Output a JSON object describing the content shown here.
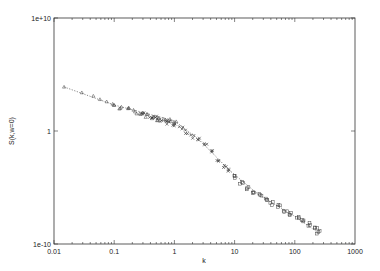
{
  "chart_data": {
    "type": "scatter",
    "title": "",
    "xlabel": "k",
    "ylabel": "S(k,w=0)",
    "xscale": "log",
    "yscale": "log",
    "xlim": [
      0.01,
      1000
    ],
    "ylim": [
      1e-10,
      10000000000.0
    ],
    "x_ticks": [
      "0.01",
      "0.1",
      "1",
      "10",
      "100",
      "1000"
    ],
    "y_ticks": [
      "1e-10",
      "1",
      "1e+10"
    ],
    "grid": false,
    "legend": null,
    "series": [
      {
        "name": "triangles",
        "marker": "triangle",
        "x": [
          0.0147,
          0.029,
          0.045,
          0.058,
          0.075,
          0.1,
          0.13,
          0.17,
          0.22,
          0.28,
          0.35,
          0.45,
          0.55,
          0.7,
          0.85,
          1.0
        ],
        "y": [
          7943,
          2512,
          1259,
          631,
          398,
          200,
          126,
          79,
          50,
          32,
          25,
          16,
          12,
          9,
          8,
          6
        ]
      },
      {
        "name": "crosses",
        "marker": "x",
        "x": [
          0.3,
          0.4,
          0.5,
          0.6,
          0.8,
          1.0,
          1.3,
          1.6,
          2.0,
          2.6,
          3.3,
          4.2,
          5.5,
          7,
          8.4
        ],
        "y": [
          30,
          20,
          14,
          10,
          6,
          4,
          1.8,
          0.8,
          0.3,
          0.16,
          0.05,
          0.013,
          0.003,
          0.0008,
          0.0003
        ]
      },
      {
        "name": "squares",
        "marker": "square",
        "x": [
          10,
          13,
          16,
          20,
          26,
          33,
          42,
          55,
          70,
          85,
          110,
          140,
          180,
          220,
          245
        ],
        "y": [
          0.0001,
          3e-05,
          1e-05,
          5e-06,
          2e-06,
          1e-06,
          4e-07,
          2e-07,
          8e-08,
          5e-08,
          2e-08,
          1e-08,
          5e-09,
          2e-09,
          1e-09
        ]
      }
    ],
    "fit_line": {
      "style": "dotted",
      "x": [
        0.0147,
        0.1,
        1.0,
        2.6,
        8.4,
        26,
        85,
        245
      ],
      "y": [
        7943,
        200,
        8,
        0.16,
        0.0003,
        2e-06,
        5e-08,
        1e-09
      ]
    }
  }
}
